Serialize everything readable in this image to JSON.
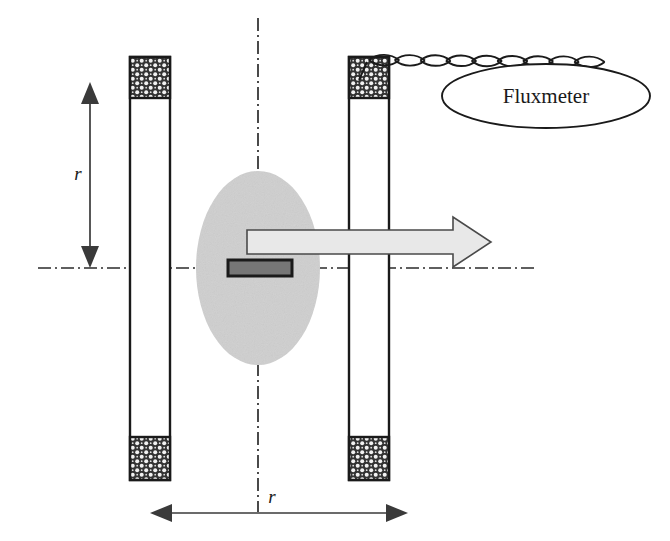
{
  "figure": {
    "background_color": "#ffffff",
    "width": 670,
    "height": 541
  },
  "labels": {
    "fluxmeter": "Fluxmeter",
    "radius_vertical": "r",
    "radius_horizontal": "r"
  },
  "colors": {
    "stroke": "#1a1a1a",
    "winding_fill": "#333333",
    "winding_dot": "#f2f2f2",
    "bobbin_fill": "#ffffff",
    "sample_ellipse_fill": "#cfcfcf",
    "sample_bar_fill": "#767676",
    "sample_bar_stroke": "#1a1a1a",
    "field_arrow_fill": "#e8e8e8",
    "field_arrow_stroke": "#4a4a4a",
    "axis_line": "#2b2b2b",
    "dim_arrow_fill": "#3a3a3a"
  },
  "elements": {
    "left_coil": {
      "name": "left-coil",
      "bobbin_x": 130,
      "bobbin_y": 57,
      "bobbin_width": 40,
      "bobbin_height": 423,
      "top_winding_y": 57,
      "top_winding_height": 41,
      "bottom_winding_y": 437,
      "bottom_winding_height": 43
    },
    "right_coil": {
      "name": "right-coil",
      "bobbin_x": 349,
      "bobbin_y": 57,
      "bobbin_width": 40,
      "bobbin_height": 423,
      "top_winding_y": 57,
      "top_winding_height": 41,
      "bottom_winding_y": 437,
      "bottom_winding_height": 43
    },
    "sample_ellipse": {
      "name": "sample-region-ellipse",
      "cx": 258,
      "cy": 268,
      "rx": 62,
      "ry": 97
    },
    "sample_bar": {
      "name": "specimen-bar",
      "x": 228,
      "y": 260,
      "width": 64,
      "height": 16
    },
    "field_arrow": {
      "name": "field-direction-arrow",
      "tail_x": 247,
      "tip_x": 491,
      "center_y": 242,
      "shaft_half_height": 12,
      "head_half_height": 25,
      "head_length": 38
    },
    "vertical_axis": {
      "name": "vertical-centerline",
      "x": 258,
      "y1": 18,
      "y2": 512
    },
    "horizontal_axis": {
      "name": "horizontal-centerline",
      "y": 268,
      "x1": 38,
      "x2": 538
    },
    "vertical_dimension": {
      "name": "vertical-radius-dimension",
      "x": 90,
      "y_top": 82,
      "y_bottom": 268,
      "label_x": 78,
      "label_y": 180
    },
    "horizontal_dimension": {
      "name": "horizontal-radius-dimension",
      "y": 513,
      "x_left": 150,
      "x_right": 408,
      "label_x": 272,
      "label_y": 503
    },
    "twisted_wire": {
      "name": "twisted-pair-lead",
      "start_x": 369,
      "start_y": 60,
      "end_x": 600,
      "end_y": 62,
      "loop_count": 9
    },
    "fluxmeter_ellipse": {
      "name": "fluxmeter-body",
      "cx": 546,
      "cy": 96,
      "rx": 104,
      "ry": 32,
      "label_x": 546,
      "label_y": 103
    }
  }
}
